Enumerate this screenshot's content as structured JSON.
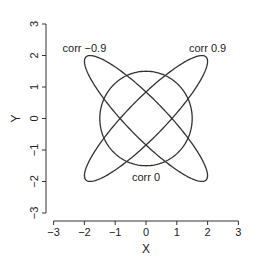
{
  "chart_data": {
    "type": "line",
    "title": "",
    "xlabel": "X",
    "ylabel": "Y",
    "xlim": [
      -3,
      3
    ],
    "ylim": [
      -3,
      3
    ],
    "xticks": [
      -3,
      -2,
      -1,
      0,
      1,
      2,
      3
    ],
    "yticks": [
      -3,
      -2,
      -1,
      0,
      1,
      2,
      3
    ],
    "grid": false,
    "legend": null,
    "series": [
      {
        "name": "corr -0.9",
        "shape": "ellipse",
        "center": [
          0,
          0
        ],
        "angle_deg": -45,
        "semi_major": 2.76,
        "semi_minor": 0.61,
        "x_extent": [
          -2.0,
          2.0
        ],
        "y_extent": [
          -2.0,
          2.0
        ]
      },
      {
        "name": "corr 0.9",
        "shape": "ellipse",
        "center": [
          0,
          0
        ],
        "angle_deg": 45,
        "semi_major": 2.76,
        "semi_minor": 0.61,
        "x_extent": [
          -2.0,
          2.0
        ],
        "y_extent": [
          -2.0,
          2.0
        ]
      },
      {
        "name": "corr 0",
        "shape": "circle",
        "center": [
          0,
          0
        ],
        "radius": 1.5
      }
    ],
    "annotations": [
      {
        "text": "corr −0.9",
        "x": -2.0,
        "y": 2.25
      },
      {
        "text": "corr 0.9",
        "x": 2.0,
        "y": 2.25
      },
      {
        "text": "corr 0",
        "x": 0.0,
        "y": -1.85
      }
    ]
  },
  "axes": {
    "x_title": "X",
    "y_title": "Y",
    "x_tick_labels": [
      "−3",
      "−2",
      "−1",
      "0",
      "1",
      "2",
      "3"
    ],
    "y_tick_labels": [
      "−3",
      "−2",
      "−1",
      "0",
      "1",
      "2",
      "3"
    ]
  },
  "colors": {
    "line": "#333333",
    "background": "#ffffff"
  }
}
